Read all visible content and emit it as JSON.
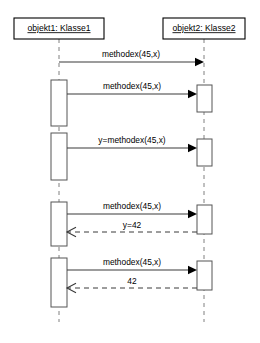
{
  "diagram": {
    "type": "uml-sequence-diagram",
    "title": "",
    "background_color": "#ffffff",
    "line_color": "#3a3a3a",
    "lifeline_color": "#808080",
    "activation_fill": "#ffffff",
    "activation_stroke": "#555555",
    "width": 260,
    "height": 343
  },
  "participants": [
    {
      "id": "objekt1",
      "label": "objekt1: Klasse1",
      "underlined": true,
      "box": {
        "x": 14,
        "y": 18,
        "width": 90,
        "height": 21
      },
      "lifeline_x": 59,
      "lifeline_top": 39,
      "lifeline_bottom": 322
    },
    {
      "id": "objekt2",
      "label": "objekt2: Klasse2",
      "underlined": true,
      "box": {
        "x": 163,
        "y": 18,
        "width": 82,
        "height": 21
      },
      "lifeline_x": 204,
      "lifeline_top": 39,
      "lifeline_bottom": 322
    }
  ],
  "activations": [
    {
      "id": "act-left-1",
      "participant": "objekt1",
      "x": 51,
      "y": 80,
      "width": 16,
      "height": 46
    },
    {
      "id": "act-left-2",
      "participant": "objekt1",
      "x": 51,
      "y": 133,
      "width": 16,
      "height": 47
    },
    {
      "id": "act-left-3",
      "participant": "objekt1",
      "x": 51,
      "y": 202,
      "width": 16,
      "height": 44
    },
    {
      "id": "act-left-4",
      "participant": "objekt1",
      "x": 51,
      "y": 258,
      "width": 16,
      "height": 49
    },
    {
      "id": "act-right-1",
      "participant": "objekt2",
      "x": 197,
      "y": 85,
      "width": 15,
      "height": 27
    },
    {
      "id": "act-right-2",
      "participant": "objekt2",
      "x": 197,
      "y": 139,
      "width": 15,
      "height": 27
    },
    {
      "id": "act-right-3",
      "participant": "objekt2",
      "x": 197,
      "y": 205,
      "width": 15,
      "height": 29
    },
    {
      "id": "act-right-4",
      "participant": "objekt2",
      "x": 197,
      "y": 261,
      "width": 15,
      "height": 29
    }
  ],
  "messages": [
    {
      "id": "msg-1",
      "label": "methodex(45,x)",
      "kind": "call",
      "direction": "right",
      "style": "solid",
      "arrowhead": "filled",
      "from_x": 59,
      "to_x": 204,
      "y": 62,
      "label_x": 131,
      "label_y": 57
    },
    {
      "id": "msg-2",
      "label": "methodex(45,x)",
      "kind": "call",
      "direction": "right",
      "style": "solid",
      "arrowhead": "filled",
      "from_x": 67,
      "to_x": 197,
      "y": 94,
      "label_x": 132,
      "label_y": 89
    },
    {
      "id": "msg-3",
      "label": "y=methodex(45,x)",
      "kind": "call",
      "direction": "right",
      "style": "solid",
      "arrowhead": "filled",
      "from_x": 67,
      "to_x": 197,
      "y": 148,
      "label_x": 132,
      "label_y": 143
    },
    {
      "id": "msg-4",
      "label": "methodex(45,x)",
      "kind": "call",
      "direction": "right",
      "style": "solid",
      "arrowhead": "filled",
      "from_x": 67,
      "to_x": 197,
      "y": 214,
      "label_x": 132,
      "label_y": 209
    },
    {
      "id": "msg-5",
      "label": "y=42",
      "kind": "return",
      "direction": "left",
      "style": "dashed",
      "arrowhead": "open",
      "from_x": 197,
      "to_x": 67,
      "y": 232,
      "label_x": 132,
      "label_y": 228
    },
    {
      "id": "msg-6",
      "label": "methodex(45,x)",
      "kind": "call",
      "direction": "right",
      "style": "solid",
      "arrowhead": "filled",
      "from_x": 67,
      "to_x": 197,
      "y": 270,
      "label_x": 132,
      "label_y": 265
    },
    {
      "id": "msg-7",
      "label": "42",
      "kind": "return",
      "direction": "left",
      "style": "dashed",
      "arrowhead": "open",
      "from_x": 197,
      "to_x": 67,
      "y": 288,
      "label_x": 132,
      "label_y": 284
    }
  ]
}
